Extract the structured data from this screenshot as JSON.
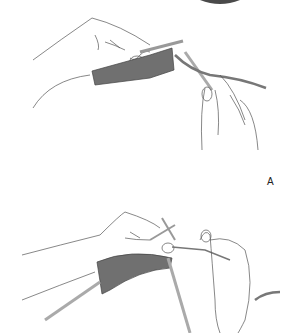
{
  "figure": {
    "label": "A",
    "panels": [
      {
        "name": "top-panel",
        "description": "hands holding knitting needles with garter-stitch fabric, yarn to right"
      },
      {
        "name": "bottom-panel",
        "description": "hands working stitch with right needle inserted, yarn wrapped"
      }
    ],
    "colors": {
      "line": "#555555",
      "fabric": "#707070",
      "needle": "#b8b8b8",
      "yarn": "#808080"
    }
  }
}
